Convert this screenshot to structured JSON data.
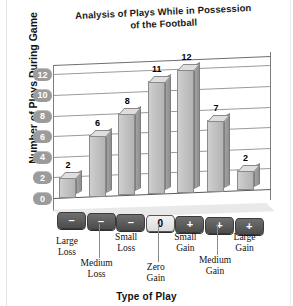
{
  "chart_data": {
    "type": "bar",
    "title": "Analysis of Plays While in Possession of the Football",
    "title_line1": "Analysis of Plays While in Possession",
    "title_line2": "of the Football",
    "xlabel": "Type of Play",
    "ylabel": "Number of Plays During Game",
    "categories": [
      "Large Loss",
      "Medium Loss",
      "Small Loss",
      "Zero Gain",
      "Small Gain",
      "Medium Gain",
      "Large Gain"
    ],
    "category_lines": [
      [
        "Large",
        "Loss"
      ],
      [
        "Medium",
        "Loss"
      ],
      [
        "Small",
        "Loss"
      ],
      [
        "Zero",
        "Gain"
      ],
      [
        "Small",
        "Gain"
      ],
      [
        "Medium",
        "Gain"
      ],
      [
        "Large",
        "Gain"
      ]
    ],
    "values": [
      2,
      6,
      8,
      11,
      12,
      7,
      2
    ],
    "base_symbols": [
      "–",
      "–",
      "–",
      "0",
      "+",
      "+",
      "+"
    ],
    "yticks": [
      12,
      10,
      8,
      6,
      4,
      2,
      0
    ],
    "ylim": [
      0,
      13
    ],
    "grid": true,
    "legend": "none",
    "style": "3d-column",
    "colors": {
      "bar_face": "#c2c2c2",
      "bar_side": "#8f8f8f",
      "bar_top": "#dedede",
      "grid": "#9a9a9a",
      "tick_badge": "#9b9b9b",
      "block_loss": "#5a5a5a",
      "block_zero": "#e8e8e8",
      "text": "#111111",
      "background": "#ffffff"
    }
  }
}
